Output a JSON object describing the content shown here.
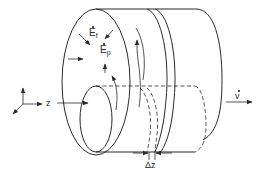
{
  "figure": {
    "labels": {
      "field_f": {
        "base": "E",
        "sub": "f",
        "dotted": true
      },
      "field_p": {
        "base": "E",
        "sub": "p",
        "dotted": true
      },
      "axis_z": "z",
      "velocity": {
        "base": "v",
        "dotted": true
      },
      "slice_thickness": "Δz"
    },
    "colors": {
      "line": "#2a2a2a",
      "background": "#ffffff"
    }
  }
}
